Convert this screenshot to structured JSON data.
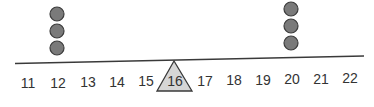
{
  "diagram": {
    "type": "balance-beam-number-line",
    "labels": [
      "11",
      "12",
      "13",
      "14",
      "15",
      "16",
      "17",
      "18",
      "19",
      "20",
      "21",
      "22"
    ],
    "fulcrum_label": "16",
    "weights": [
      {
        "position": "12",
        "count": 3
      },
      {
        "position": "20",
        "count": 3
      }
    ],
    "colors": {
      "beam": "#3a3a3a",
      "weight_fill": "#7a7a7a",
      "weight_stroke": "#3c3c3c",
      "fulcrum_fill": "#d6d6d6",
      "fulcrum_stroke": "#3a3a3a",
      "label": "#333333"
    }
  }
}
